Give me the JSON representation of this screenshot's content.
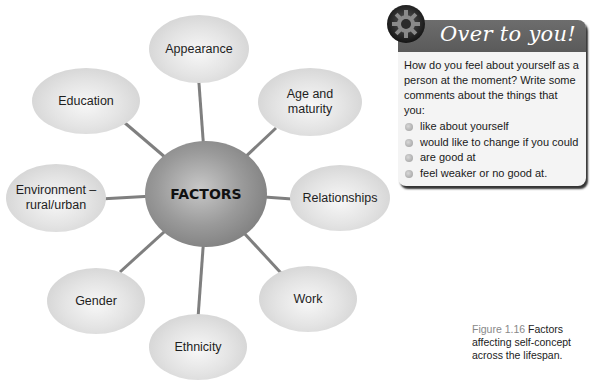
{
  "diagram": {
    "center": {
      "label": "FACTORS"
    },
    "nodes": [
      {
        "id": "appearance",
        "label": "Appearance"
      },
      {
        "id": "age",
        "label": "Age and maturity"
      },
      {
        "id": "relationships",
        "label": "Relationships"
      },
      {
        "id": "work",
        "label": "Work"
      },
      {
        "id": "ethnicity",
        "label": "Ethnicity"
      },
      {
        "id": "gender",
        "label": "Gender"
      },
      {
        "id": "environment",
        "label": "Environment – rural/urban"
      },
      {
        "id": "education",
        "label": "Education"
      }
    ]
  },
  "over_to_you": {
    "title": "Over to you!",
    "icon": "gear-icon",
    "intro": "How do you feel about yourself as a person at the moment? Write some comments about the things that you:",
    "items": [
      "like about yourself",
      "would like to change if you could",
      "are good at",
      "feel weaker or no good at."
    ]
  },
  "caption": {
    "figure_label": "Figure 1.16",
    "text": " Factors affecting self-concept across the lifespan."
  },
  "colors": {
    "header_bg": "#626262",
    "box_bg": "#f4f4f4",
    "connector": "#7a7a7a"
  }
}
